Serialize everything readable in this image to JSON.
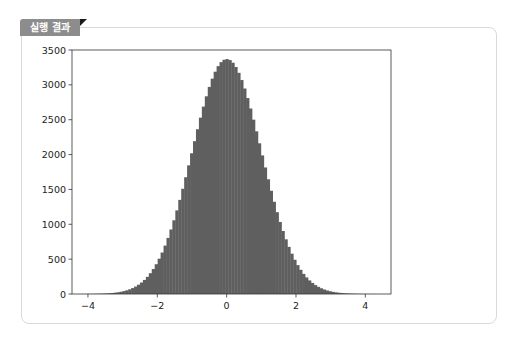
{
  "tab": {
    "label": "실행 결과"
  },
  "colors": {
    "bar": "#5f5f5f",
    "axis": "#333333",
    "tab": "#8c8c8c"
  },
  "chart_data": {
    "type": "bar",
    "subtype": "histogram",
    "title": "",
    "xlabel": "",
    "ylabel": "",
    "xlim": [
      -4.46,
      4.74
    ],
    "ylim": [
      0,
      3500
    ],
    "xticks": [
      -4,
      -2,
      0,
      2,
      4
    ],
    "yticks": [
      0,
      500,
      1000,
      1500,
      2000,
      2500,
      3000,
      3500
    ],
    "grid": false,
    "bins": 100,
    "bin_range": [
      -4.2,
      4.3
    ],
    "values": [
      1,
      1,
      2,
      2,
      3,
      4,
      5,
      7,
      9,
      12,
      16,
      20,
      26,
      34,
      43,
      55,
      68,
      85,
      104,
      127,
      153,
      183,
      218,
      257,
      300,
      349,
      402,
      460,
      522,
      589,
      660,
      735,
      813,
      895,
      980,
      1067,
      1156,
      1247,
      1339,
      1432,
      1524,
      1615,
      1705,
      1793,
      1877,
      1958,
      2035,
      2108,
      2176,
      2240,
      2298,
      2352,
      2400,
      2444,
      2484,
      2521,
      2555,
      2590,
      2632,
      2680,
      2740,
      2810,
      2880,
      2960,
      3040,
      3120,
      3190,
      3250,
      3300,
      3330,
      3350,
      3370,
      3330,
      3345,
      3320,
      3290,
      3240,
      3180,
      3100,
      3020,
      2930,
      2830,
      2720,
      2600,
      2480,
      2350,
      2210,
      2060,
      1920,
      1780,
      1640,
      1500,
      1360,
      1230,
      1100,
      980,
      860,
      760,
      660,
      570
    ]
  }
}
